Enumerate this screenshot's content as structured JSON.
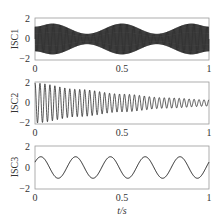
{
  "chart_data": [
    {
      "type": "line",
      "title": "",
      "ylabel": "ISC1",
      "xlabel": "",
      "xlim": [
        0,
        1
      ],
      "ylim": [
        -2,
        2
      ],
      "xticks": [
        "0",
        "0.5",
        "1"
      ],
      "yticks": [
        "2",
        "0",
        "-2"
      ],
      "description": "High-frequency oscillation with amplitude envelope varying between ~0.5 and ~1.5, envelope peaks near t=0.1, 0.5, 0.9",
      "envelope": {
        "x": [
          0,
          0.1,
          0.3,
          0.5,
          0.7,
          0.9,
          1.0
        ],
        "amplitude": [
          1.2,
          1.5,
          0.5,
          1.5,
          0.5,
          1.5,
          1.2
        ]
      },
      "carrier_freq_hz": 200
    },
    {
      "type": "line",
      "title": "",
      "ylabel": "ISC2",
      "xlabel": "",
      "xlim": [
        0,
        1
      ],
      "ylim": [
        -2,
        2
      ],
      "xticks": [
        "0",
        "0.5",
        "1"
      ],
      "yticks": [
        "2",
        "0",
        "-2"
      ],
      "description": "Decaying sinusoid ~35 Hz, amplitude decays from ~1.9 to ~0.3",
      "freq_hz": 35,
      "envelope": {
        "x": [
          0,
          0.25,
          0.5,
          0.75,
          1.0
        ],
        "amplitude": [
          1.9,
          1.3,
          0.85,
          0.5,
          0.3
        ]
      }
    },
    {
      "type": "line",
      "title": "",
      "ylabel": "ISC3",
      "xlabel": "t/s",
      "xlim": [
        0,
        1
      ],
      "ylim": [
        -2,
        2
      ],
      "xticks": [
        "0",
        "0.5",
        "1"
      ],
      "yticks": [
        "2",
        "0",
        "-2"
      ],
      "description": "Sinusoid 5 Hz, amplitude 1, starting near 0.5",
      "freq_hz": 5,
      "amplitude": 1,
      "phase_deg": 30
    }
  ],
  "labels": {
    "isc1": "ISC1",
    "isc2": "ISC2",
    "isc3": "ISC3",
    "xlabel": "t/s",
    "y_top": "2",
    "y_mid": "0",
    "y_bot": "−2",
    "x0": "0",
    "x05": "0.5",
    "x1": "1"
  }
}
